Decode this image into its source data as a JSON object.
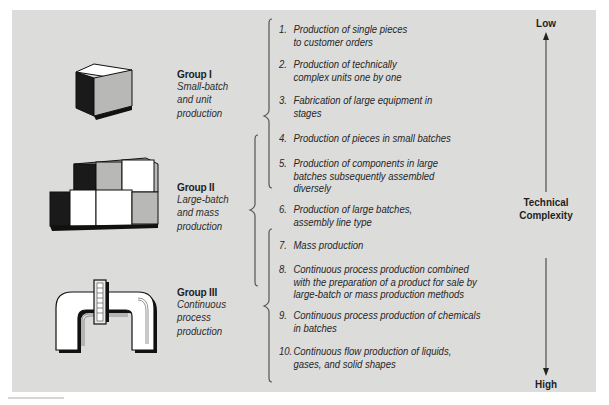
{
  "groups": [
    {
      "title": "Group I",
      "subtitle_lines": [
        "Small-batch",
        "and unit",
        "production"
      ],
      "icon": "single-cube-icon"
    },
    {
      "title": "Group II",
      "subtitle_lines": [
        "Large-batch",
        "and mass",
        "production"
      ],
      "icon": "stacked-cubes-icon"
    },
    {
      "title": "Group III",
      "subtitle_lines": [
        "Continuous",
        "process",
        "production"
      ],
      "icon": "pipe-flange-icon"
    }
  ],
  "items": [
    {
      "num": "1.",
      "lines": [
        "Production of single pieces",
        "to customer orders"
      ]
    },
    {
      "num": "2.",
      "lines": [
        "Production of technically",
        "complex units one by one"
      ]
    },
    {
      "num": "3.",
      "lines": [
        "Fabrication of large equipment in",
        "stages"
      ]
    },
    {
      "num": "4.",
      "lines": [
        "Production of pieces in small batches"
      ]
    },
    {
      "num": "5.",
      "lines": [
        "Production of components in large",
        "batches subsequently assembled",
        "diversely"
      ]
    },
    {
      "num": "6.",
      "lines": [
        "Production of large batches,",
        "assembly line type"
      ]
    },
    {
      "num": "7.",
      "lines": [
        "Mass production"
      ]
    },
    {
      "num": "8.",
      "lines": [
        "Continuous process production combined",
        "with the preparation of a product for sale by",
        "large-batch or mass production methods"
      ]
    },
    {
      "num": "9.",
      "lines": [
        "Continuous process production of chemicals",
        "in batches"
      ]
    },
    {
      "num": "10.",
      "lines": [
        "Continuous flow production of liquids,",
        "gases, and solid shapes"
      ]
    }
  ],
  "brackets": [
    {
      "group": "Group I",
      "items": "1-5"
    },
    {
      "group": "Group II",
      "items": "4-8"
    },
    {
      "group": "Group III",
      "items": "7-10"
    }
  ],
  "axis": {
    "top_label": "Low",
    "bottom_label": "High",
    "middle_label_line1": "Technical",
    "middle_label_line2": "Complexity",
    "icon": "double-arrow-vertical-icon"
  },
  "colors": {
    "panel_bg": "#dcdcdb",
    "text": "#262626",
    "bracket": "#555555"
  }
}
